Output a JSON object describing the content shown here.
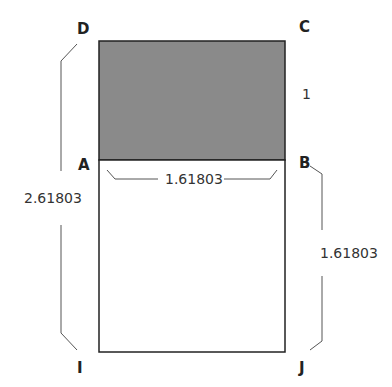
{
  "diagram": {
    "colors": {
      "shaded": "#8a8a8a",
      "stroke": "#222222",
      "bracket": "#555555",
      "background": "#ffffff"
    },
    "points": {
      "D": "D",
      "C": "C",
      "A": "A",
      "B": "B",
      "I": "I",
      "J": "J"
    },
    "measurements": {
      "square_side": "1",
      "width_AB": "1.61803",
      "lower_BJ": "1.61803",
      "total_DI": "2.61803"
    }
  }
}
